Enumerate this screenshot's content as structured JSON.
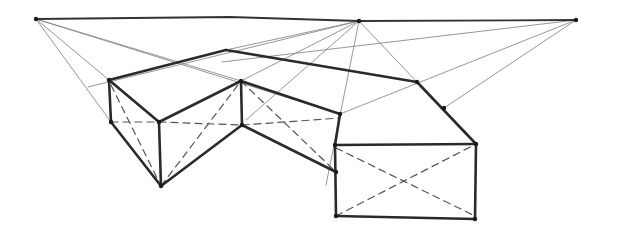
{
  "colors": {
    "ink": "#2a2a2a",
    "guide": "#8a8a8a",
    "background": "#ffffff"
  },
  "vanishing_points": {
    "left": [
      36,
      19
    ],
    "center": [
      359,
      21
    ],
    "right": [
      576,
      20
    ]
  },
  "horizon": [
    [
      36,
      19
    ],
    [
      230,
      17
    ],
    [
      359,
      21
    ],
    [
      576,
      20
    ]
  ],
  "guide_lines": [
    [
      [
        36,
        19
      ],
      [
        109,
        80
      ]
    ],
    [
      [
        36,
        19
      ],
      [
        111,
        122
      ]
    ],
    [
      [
        36,
        19
      ],
      [
        241,
        81
      ]
    ],
    [
      [
        36,
        19
      ],
      [
        340,
        114
      ]
    ],
    [
      [
        359,
        21
      ],
      [
        226,
        50
      ]
    ],
    [
      [
        359,
        21
      ],
      [
        241,
        81
      ]
    ],
    [
      [
        359,
        21
      ],
      [
        246,
        120
      ]
    ],
    [
      [
        359,
        21
      ],
      [
        417,
        82
      ]
    ],
    [
      [
        359,
        21
      ],
      [
        326,
        185
      ]
    ],
    [
      [
        359,
        21
      ],
      [
        88,
        87
      ]
    ],
    [
      [
        576,
        20
      ],
      [
        340,
        114
      ]
    ],
    [
      [
        576,
        20
      ],
      [
        444,
        108
      ]
    ],
    [
      [
        576,
        20
      ],
      [
        222,
        62
      ]
    ]
  ],
  "bold_lines": [
    [
      [
        109,
        80
      ],
      [
        226,
        50
      ]
    ],
    [
      [
        226,
        50
      ],
      [
        417,
        82
      ]
    ],
    [
      [
        109,
        80
      ],
      [
        159,
        122
      ]
    ],
    [
      [
        159,
        122
      ],
      [
        241,
        81
      ]
    ],
    [
      [
        109,
        80
      ],
      [
        111,
        122
      ]
    ],
    [
      [
        111,
        122
      ],
      [
        161,
        186
      ]
    ],
    [
      [
        159,
        122
      ],
      [
        161,
        186
      ]
    ],
    [
      [
        161,
        186
      ],
      [
        242,
        125
      ]
    ],
    [
      [
        241,
        81
      ],
      [
        242,
        125
      ]
    ],
    [
      [
        241,
        81
      ],
      [
        340,
        114
      ]
    ],
    [
      [
        242,
        125
      ],
      [
        336,
        172
      ]
    ],
    [
      [
        340,
        114
      ],
      [
        335,
        145
      ]
    ],
    [
      [
        335,
        145
      ],
      [
        336,
        216
      ]
    ],
    [
      [
        417,
        82
      ],
      [
        476,
        144
      ]
    ],
    [
      [
        335,
        145
      ],
      [
        476,
        144
      ]
    ],
    [
      [
        476,
        144
      ],
      [
        475,
        219
      ]
    ],
    [
      [
        336,
        216
      ],
      [
        475,
        219
      ]
    ]
  ],
  "dashed_lines": [
    [
      [
        111,
        122
      ],
      [
        159,
        122
      ]
    ],
    [
      [
        159,
        122
      ],
      [
        242,
        125
      ]
    ],
    [
      [
        242,
        125
      ],
      [
        340,
        118
      ]
    ],
    [
      [
        111,
        85
      ],
      [
        161,
        186
      ]
    ],
    [
      [
        161,
        186
      ],
      [
        241,
        81
      ]
    ],
    [
      [
        241,
        81
      ],
      [
        336,
        172
      ]
    ],
    [
      [
        336,
        148
      ],
      [
        475,
        216
      ]
    ],
    [
      [
        336,
        216
      ],
      [
        476,
        144
      ]
    ]
  ],
  "points": [
    [
      36,
      19
    ],
    [
      359,
      21
    ],
    [
      576,
      20
    ],
    [
      109,
      80
    ],
    [
      111,
      122
    ],
    [
      159,
      122
    ],
    [
      161,
      186
    ],
    [
      241,
      81
    ],
    [
      242,
      125
    ],
    [
      340,
      114
    ],
    [
      335,
      145
    ],
    [
      336,
      172
    ],
    [
      476,
      144
    ],
    [
      336,
      216
    ],
    [
      475,
      219
    ],
    [
      417,
      82
    ],
    [
      444,
      108
    ]
  ]
}
